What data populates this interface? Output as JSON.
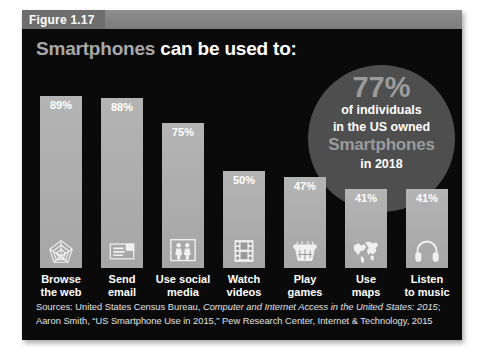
{
  "figure": {
    "tab_label": "Figure 1.17",
    "title_accent": "Smartphones",
    "title_plain": "can be used to:"
  },
  "callout": {
    "percent": "77%",
    "line1": "of individuals",
    "line2": "in the US owned",
    "line3": "Smartphones",
    "line4": "in 2018"
  },
  "sources": {
    "line1_prefix": "Sources: United States Census Bureau, ",
    "line1_italic": "Computer and Internet Access in the United States: 2015",
    "line1_suffix": ";",
    "line2": "Aaron Smith, “US Smartphone Use in 2015,” Pew Research Center, Internet & Technology, 2015"
  },
  "colors": {
    "panel_background": "#0a0a0a",
    "bar_fill": "#adadad",
    "callout_fill": "#4e4e4e",
    "accent_text": "#9b9b9b",
    "header_strip": "#8d8d8d",
    "tab_fill": "#6e6e6e"
  },
  "chart_data": {
    "type": "bar",
    "title": "Smartphones can be used to:",
    "xlabel": "",
    "ylabel": "",
    "ylim": [
      0,
      100
    ],
    "grid": false,
    "legend": "none",
    "categories": [
      "Browse the web",
      "Send email",
      "Use social media",
      "Watch videos",
      "Play games",
      "Use maps",
      "Listen to music"
    ],
    "values": [
      89,
      88,
      75,
      50,
      47,
      41,
      41
    ],
    "value_labels": [
      "89%",
      "88%",
      "75%",
      "50%",
      "47%",
      "41%",
      "41%"
    ],
    "label_lines": [
      [
        "Browse",
        "the web"
      ],
      [
        "Send",
        "email"
      ],
      [
        "Use social",
        "media"
      ],
      [
        "Watch",
        "videos"
      ],
      [
        "Play",
        "games"
      ],
      [
        "Use",
        "maps"
      ],
      [
        "Listen",
        "to music"
      ]
    ],
    "icons": [
      "spider-web-icon",
      "envelope-icon",
      "people-icon",
      "film-strip-icon",
      "arcade-game-icon",
      "world-map-icon",
      "headphones-icon"
    ]
  }
}
